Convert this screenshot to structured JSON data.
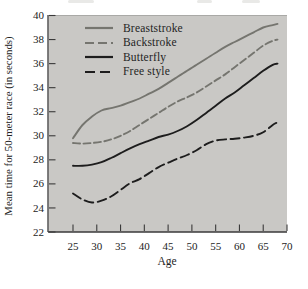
{
  "window": {
    "width": 308,
    "height": 289,
    "background": "#ffffff"
  },
  "colors": {
    "plot_background": "#c9c8c5",
    "plot_top_edge": "#a9a9a6",
    "axis_line": "#3a3a3a",
    "tick_text": "#232323",
    "gray_series": "#75756f",
    "black_series": "#1d1d1d"
  },
  "chart_data": {
    "type": "line",
    "title": "",
    "xlabel": "Age",
    "ylabel": "Mean time for 50-meter race (in seconds)",
    "xlim": [
      19.7,
      70
    ],
    "ylim": [
      22,
      40
    ],
    "x_ticks": [
      25,
      30,
      35,
      40,
      45,
      50,
      55,
      60,
      65,
      70
    ],
    "y_ticks": [
      22,
      24,
      26,
      28,
      30,
      32,
      34,
      36,
      38,
      40
    ],
    "grid": false,
    "legend_position": "top-left",
    "x": [
      25,
      27,
      29,
      31,
      33,
      35,
      37,
      39,
      41,
      43,
      45,
      47,
      49,
      51,
      53,
      55,
      57,
      59,
      61,
      63,
      65,
      67,
      68
    ],
    "series": [
      {
        "name": "Breaststroke",
        "color": "#75756f",
        "dash": "solid",
        "values": [
          29.8,
          30.9,
          31.6,
          32.1,
          32.3,
          32.5,
          32.8,
          33.1,
          33.5,
          33.9,
          34.4,
          34.9,
          35.4,
          35.9,
          36.4,
          36.9,
          37.4,
          37.8,
          38.2,
          38.6,
          39.0,
          39.2,
          39.3
        ]
      },
      {
        "name": "Backstroke",
        "color": "#75756f",
        "dash": "dashed",
        "values": [
          29.4,
          29.35,
          29.4,
          29.5,
          29.7,
          30.0,
          30.4,
          30.9,
          31.4,
          31.9,
          32.4,
          32.85,
          33.2,
          33.6,
          34.1,
          34.6,
          35.1,
          35.7,
          36.3,
          36.9,
          37.5,
          37.9,
          38.0
        ]
      },
      {
        "name": "Butterfly",
        "color": "#1d1d1d",
        "dash": "solid",
        "values": [
          27.5,
          27.5,
          27.6,
          27.8,
          28.15,
          28.55,
          28.95,
          29.3,
          29.6,
          29.9,
          30.1,
          30.4,
          30.8,
          31.3,
          31.9,
          32.5,
          33.1,
          33.6,
          34.2,
          34.8,
          35.4,
          35.9,
          36.0
        ]
      },
      {
        "name": "Free style",
        "color": "#1d1d1d",
        "dash": "dashed",
        "values": [
          25.2,
          24.7,
          24.45,
          24.6,
          24.95,
          25.5,
          26.05,
          26.4,
          26.9,
          27.4,
          27.75,
          28.1,
          28.4,
          28.8,
          29.3,
          29.6,
          29.7,
          29.75,
          29.85,
          30.0,
          30.3,
          30.9,
          31.1
        ]
      }
    ]
  }
}
